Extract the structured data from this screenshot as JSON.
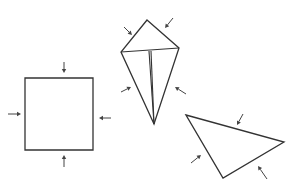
{
  "diagram": {
    "colors": {
      "line": "#333333",
      "background": "#ffffff"
    },
    "shapes": [
      {
        "id": "square",
        "type": "polygon",
        "points": [
          [
            25,
            78
          ],
          [
            93,
            78
          ],
          [
            93,
            150
          ],
          [
            25,
            150
          ]
        ],
        "arrows": [
          {
            "from": [
              64,
              62
            ],
            "to": [
              64,
              73
            ]
          },
          {
            "from": [
              8,
              114
            ],
            "to": [
              21,
              114
            ]
          },
          {
            "from": [
              111,
              118
            ],
            "to": [
              99,
              118
            ]
          },
          {
            "from": [
              64,
              167
            ],
            "to": [
              64,
              155
            ]
          }
        ]
      },
      {
        "id": "kite",
        "type": "polygon",
        "points": [
          [
            147,
            20
          ],
          [
            179,
            48
          ],
          [
            154,
            124
          ],
          [
            121,
            52
          ]
        ],
        "creases": [
          [
            [
              121,
              52
            ],
            [
              179,
              48
            ]
          ],
          [
            [
              149,
              51
            ],
            [
              154,
              124
            ]
          ],
          [
            [
              151,
              51
            ],
            [
              154,
              124
            ]
          ]
        ],
        "arrows": [
          {
            "from": [
              124,
              27
            ],
            "to": [
              132,
              35
            ]
          },
          {
            "from": [
              173,
              18
            ],
            "to": [
              165,
              28
            ]
          },
          {
            "from": [
              121,
              92
            ],
            "to": [
              131,
              87
            ]
          },
          {
            "from": [
              186,
              94
            ],
            "to": [
              175,
              87
            ]
          }
        ]
      },
      {
        "id": "triangle",
        "type": "polygon",
        "points": [
          [
            186,
            115
          ],
          [
            284,
            142
          ],
          [
            223,
            178
          ]
        ],
        "arrows": [
          {
            "from": [
              243,
              114
            ],
            "to": [
              237,
              125
            ]
          },
          {
            "from": [
              191,
              163
            ],
            "to": [
              201,
              155
            ]
          },
          {
            "from": [
              267,
              179
            ],
            "to": [
              258,
              166
            ]
          }
        ]
      }
    ]
  }
}
